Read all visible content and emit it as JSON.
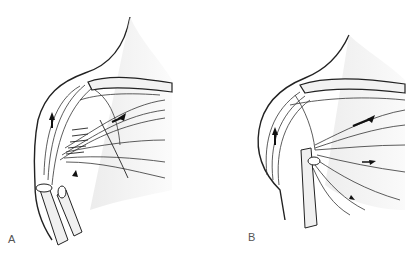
{
  "figure": {
    "panels": [
      {
        "id": "A",
        "label": "A",
        "description": "Shoulder/pectoral muscle anatomy with vessels and sutured tissue, arrows indicating movement"
      },
      {
        "id": "B",
        "label": "B",
        "description": "Shoulder/pectoral muscle anatomy after repositioning, arrows indicating movement"
      }
    ]
  },
  "colors": {
    "line": "#222222",
    "shade": "#d8d8d8",
    "background": "#ffffff"
  }
}
